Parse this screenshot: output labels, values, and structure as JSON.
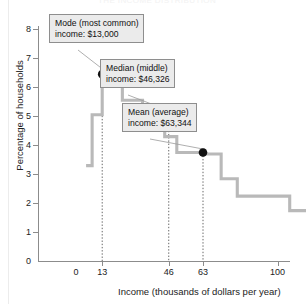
{
  "figure": {
    "cut_off_title": "THE INCOME DISTRIBUTION",
    "ylabel": "Percentage of households",
    "xlabel": "Income (thousands of dollars per year)"
  },
  "callouts": {
    "mode": {
      "line1": "Mode (most common)",
      "line2": "income: $13,000"
    },
    "median": {
      "line1": "Median (middle)",
      "line2": "income: $46,326"
    },
    "mean": {
      "line1": "Mean (average)",
      "line2": "income: $63,344"
    }
  },
  "yticks": [
    "8",
    "7",
    "6",
    "5",
    "4",
    "3",
    "2",
    "1",
    "0"
  ],
  "xticks": [
    "0",
    "13",
    "46",
    "63",
    "100",
    "150",
    "200",
    "250"
  ],
  "colors": {
    "curve": "#b9b9b9",
    "axis": "#8c8c8c",
    "marker": "#111111",
    "callout_fill": "#ebebeb",
    "callout_border": "#8e8e8e",
    "dropline": "#555555"
  },
  "chart_data": {
    "type": "line",
    "title": "THE INCOME DISTRIBUTION",
    "xlabel": "Income (thousands of dollars per year)",
    "ylabel": "Percentage of households",
    "xlim": [
      0,
      258
    ],
    "ylim": [
      0,
      8.4
    ],
    "xticks": [
      0,
      13,
      46,
      63,
      100,
      150,
      200,
      250
    ],
    "yticks": [
      0,
      1,
      2,
      3,
      4,
      5,
      6,
      7,
      8
    ],
    "grid": false,
    "legend": null,
    "step_style": "post",
    "note": "Staircase histogram of US household income; bin left edges (thousands of $) with percentage of households in each bin.",
    "series": [
      {
        "name": "Percentage of households",
        "bin_edges": [
          5,
          8,
          10,
          13,
          18,
          23,
          28,
          33,
          38,
          44,
          50,
          58,
          63,
          72,
          80,
          92,
          106,
          120,
          134,
          148,
          164,
          180,
          198,
          216,
          232,
          250
        ],
        "values": [
          3.3,
          5.05,
          5.05,
          6.45,
          6.1,
          5.55,
          5.55,
          5.1,
          5.05,
          4.3,
          3.75,
          3.75,
          3.7,
          2.85,
          2.25,
          2.25,
          1.75,
          1.5,
          1.5,
          1.2,
          0.9,
          0.9,
          0.65,
          0.45,
          0.45
        ]
      }
    ],
    "annotations": [
      {
        "name": "mode",
        "label": "Mode (most common) income: $13,000",
        "x": 13,
        "y": 6.45,
        "value_usd": 13000
      },
      {
        "name": "median",
        "label": "Median (middle) income: $46,326",
        "x": 46,
        "y": 5.05,
        "value_usd": 46326
      },
      {
        "name": "mean",
        "label": "Mean (average) income: $63,344",
        "x": 63,
        "y": 3.75,
        "value_usd": 63344
      }
    ]
  }
}
